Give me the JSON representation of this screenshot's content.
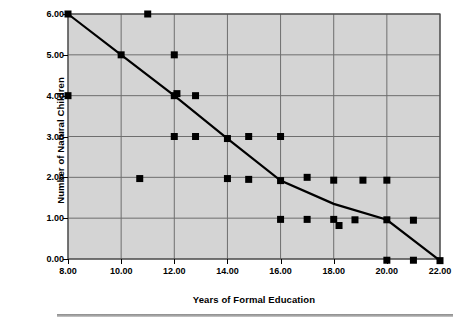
{
  "chart_data": {
    "type": "scatter",
    "title": "",
    "xlabel": "Years of Formal Education",
    "ylabel": "Number of Natural Children",
    "xlim": [
      8,
      22
    ],
    "ylim": [
      0,
      6
    ],
    "xticks": [
      8,
      10,
      12,
      14,
      16,
      18,
      20,
      22
    ],
    "xtick_labels": [
      "8.00",
      "10.00",
      "12.00",
      "14.00",
      "16.00",
      "18.00",
      "20.00",
      "22.00"
    ],
    "yticks": [
      0,
      1,
      2,
      3,
      4,
      5,
      6
    ],
    "ytick_labels": [
      "0.00",
      "1.00",
      "2.00",
      "3.00",
      "4.00",
      "5.00",
      "6.00"
    ],
    "grid": true,
    "legend": false,
    "plot_background": "#d4d4d4",
    "marker_color": "#000000",
    "marker_shape": "square",
    "line_color": "#000000",
    "points": [
      {
        "x": 8.0,
        "y": 6.0
      },
      {
        "x": 11.0,
        "y": 6.0
      },
      {
        "x": 10.0,
        "y": 5.0
      },
      {
        "x": 12.0,
        "y": 5.0
      },
      {
        "x": 8.0,
        "y": 4.0
      },
      {
        "x": 12.0,
        "y": 4.0
      },
      {
        "x": 12.1,
        "y": 4.05
      },
      {
        "x": 12.8,
        "y": 4.0
      },
      {
        "x": 12.0,
        "y": 3.0
      },
      {
        "x": 12.8,
        "y": 3.0
      },
      {
        "x": 14.0,
        "y": 2.95
      },
      {
        "x": 14.8,
        "y": 3.0
      },
      {
        "x": 16.0,
        "y": 3.0
      },
      {
        "x": 10.7,
        "y": 1.97
      },
      {
        "x": 14.0,
        "y": 1.97
      },
      {
        "x": 14.8,
        "y": 1.95
      },
      {
        "x": 16.0,
        "y": 1.92
      },
      {
        "x": 17.0,
        "y": 2.0
      },
      {
        "x": 18.0,
        "y": 1.93
      },
      {
        "x": 19.1,
        "y": 1.93
      },
      {
        "x": 20.0,
        "y": 1.93
      },
      {
        "x": 16.0,
        "y": 0.97
      },
      {
        "x": 17.0,
        "y": 0.97
      },
      {
        "x": 18.0,
        "y": 0.97
      },
      {
        "x": 18.2,
        "y": 0.82
      },
      {
        "x": 18.8,
        "y": 0.96
      },
      {
        "x": 20.0,
        "y": 0.96
      },
      {
        "x": 21.0,
        "y": 0.95
      },
      {
        "x": 20.0,
        "y": -0.03
      },
      {
        "x": 21.0,
        "y": -0.03
      },
      {
        "x": 22.0,
        "y": -0.04
      }
    ],
    "fit_line": [
      {
        "x": 8.0,
        "y": 6.0
      },
      {
        "x": 10.0,
        "y": 5.0
      },
      {
        "x": 12.0,
        "y": 4.0
      },
      {
        "x": 14.0,
        "y": 2.95
      },
      {
        "x": 16.0,
        "y": 1.92
      },
      {
        "x": 18.0,
        "y": 1.35
      },
      {
        "x": 20.0,
        "y": 0.96
      },
      {
        "x": 22.0,
        "y": -0.04
      }
    ]
  }
}
